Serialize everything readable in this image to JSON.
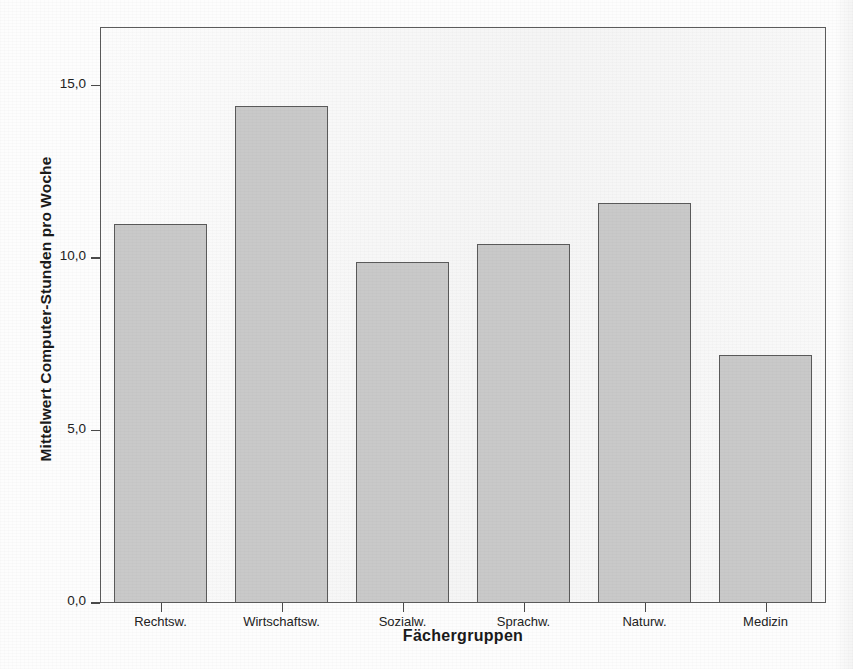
{
  "chart_data": {
    "type": "bar",
    "title": "",
    "subtitle": "",
    "xlabel": "Fächergruppen",
    "ylabel": "Mittelwert Computer-Stunden pro Woche",
    "categories": [
      "Rechtsw.",
      "Wirtschaftsw.",
      "Sozialw.",
      "Sprachw.",
      "Naturw.",
      "Medizin"
    ],
    "values": [
      11.0,
      14.4,
      9.9,
      10.4,
      11.6,
      7.2
    ],
    "ylim": [
      0.0,
      16.7
    ],
    "yticks": [
      0.0,
      5.0,
      10.0,
      15.0
    ],
    "ytick_labels": [
      "0,0",
      "5,0",
      "10,0",
      "15,0"
    ],
    "grid": false,
    "legend": "none",
    "bar_fill_color": "#c9c9c9",
    "bar_border_color": "#5a5a5a",
    "plot_background_color": "#f3f3f3",
    "frame_color": "#5b5b5b"
  }
}
